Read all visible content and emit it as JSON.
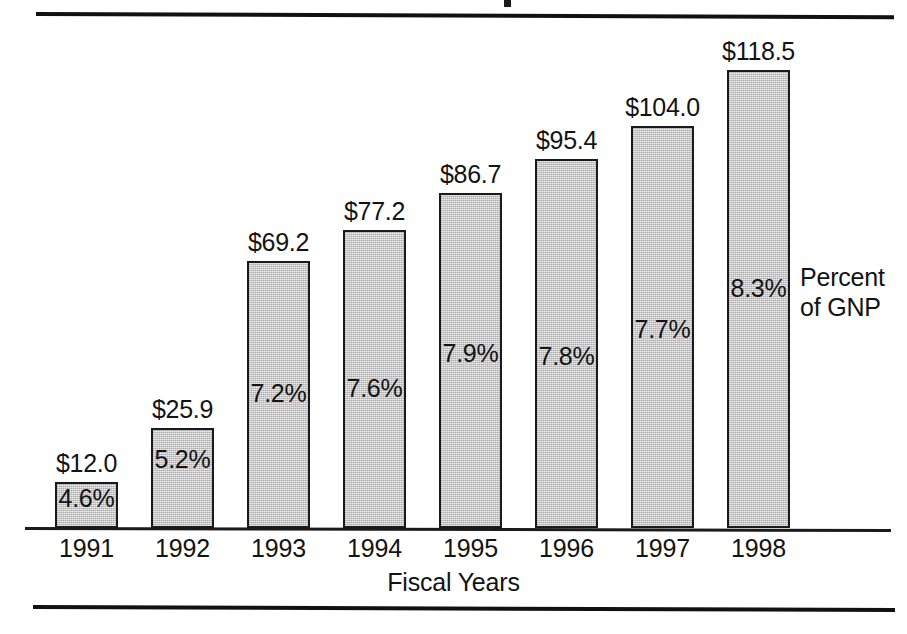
{
  "figure": {
    "axis_title": "Fiscal Years",
    "series_note_line1": "Percent",
    "series_note_line2": "of GNP",
    "bar_fill_color": "#c9c9c9",
    "bar_border_color": "#1a1a1a",
    "text_color": "#131313",
    "background_color": "#ffffff"
  },
  "chart_data": {
    "type": "bar",
    "title": "",
    "xlabel": "Fiscal Years",
    "ylabel": "",
    "categories": [
      "1991",
      "1992",
      "1993",
      "1994",
      "1995",
      "1996",
      "1997",
      "1998"
    ],
    "values": [
      12.0,
      25.9,
      69.2,
      77.2,
      86.7,
      95.4,
      104.0,
      118.5
    ],
    "value_labels": [
      "$12.0",
      "$25.9",
      "$69.2",
      "$77.2",
      "$86.7",
      "$95.4",
      "$104.0",
      "$118.5"
    ],
    "secondary_labels": [
      "4.6%",
      "5.2%",
      "7.2%",
      "7.6%",
      "7.9%",
      "7.8%",
      "7.7%",
      "8.3%"
    ],
    "secondary_values": [
      4.6,
      5.2,
      7.2,
      7.6,
      7.9,
      7.8,
      7.7,
      8.3
    ],
    "secondary_name": "Percent of GNP",
    "ylim": [
      0,
      118.5
    ],
    "grid": false,
    "legend": "right"
  }
}
